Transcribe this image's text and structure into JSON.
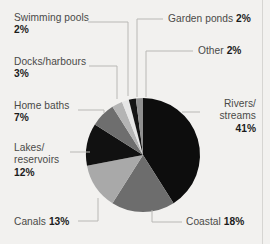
{
  "chart_data": {
    "type": "pie",
    "title": "",
    "subtitle": "",
    "xlabel": "",
    "ylabel": "",
    "legend_position": "callout-labels",
    "grid": false,
    "units": "%",
    "categories": [
      "Rivers/streams",
      "Coastal",
      "Canals",
      "Lakes/reservoirs",
      "Home baths",
      "Docks/harbours",
      "Swimming pools",
      "Garden ponds",
      "Other"
    ],
    "values": [
      41,
      18,
      13,
      12,
      7,
      3,
      2,
      2,
      2
    ],
    "slices": [
      {
        "label": "Rivers/streams",
        "value": 41,
        "value_text": "41%",
        "color": "#0d0d0d",
        "start_deg": 0,
        "end_deg": 147.6
      },
      {
        "label": "Coastal",
        "value": 18,
        "value_text": "18%",
        "color": "#6d6d6d",
        "start_deg": 147.6,
        "end_deg": 212.4
      },
      {
        "label": "Canals",
        "value": 13,
        "value_text": "13%",
        "color": "#a9a9a9",
        "start_deg": 212.4,
        "end_deg": 259.2
      },
      {
        "label": "Lakes/reservoirs",
        "value": 12,
        "value_text": "12%",
        "color": "#111111",
        "start_deg": 259.2,
        "end_deg": 302.4
      },
      {
        "label": "Home baths",
        "value": 7,
        "value_text": "7%",
        "color": "#6e6e6e",
        "start_deg": 302.4,
        "end_deg": 327.6
      },
      {
        "label": "Docks/harbours",
        "value": 3,
        "value_text": "3%",
        "color": "#b4b4b4",
        "start_deg": 327.6,
        "end_deg": 338.4
      },
      {
        "label": "Swimming pools",
        "value": 2,
        "value_text": "2%",
        "color": "#e6e6e6",
        "start_deg": 338.4,
        "end_deg": 345.6
      },
      {
        "label": "Garden ponds",
        "value": 2,
        "value_text": "2%",
        "color": "#141414",
        "start_deg": 345.6,
        "end_deg": 352.8
      },
      {
        "label": "Other",
        "value": 2,
        "value_text": "2%",
        "color": "#8f8f8f",
        "start_deg": 352.8,
        "end_deg": 360
      }
    ]
  },
  "labels": {
    "swimming_pools": {
      "name": "Swimming pools",
      "pct": "2%"
    },
    "docks_harbours": {
      "name": "Docks/harbours",
      "pct": "3%"
    },
    "home_baths": {
      "name": "Home baths",
      "pct": "7%"
    },
    "lakes_line1": "Lakes/",
    "lakes_line2": "reservoirs",
    "lakes_pct": "12%",
    "canals": {
      "name": "Canals",
      "pct": "13%"
    },
    "garden_ponds": {
      "name": "Garden ponds",
      "pct": "2%"
    },
    "other": {
      "name": "Other",
      "pct": "2%"
    },
    "rivers_line1": "Rivers/",
    "rivers_line2": "streams",
    "rivers_pct": "41%",
    "coastal": {
      "name": "Coastal",
      "pct": "18%"
    }
  },
  "colors": {
    "background": "#f2f1ef",
    "leader_line": "#b9b8b5",
    "label_text": "#4a4a48",
    "value_text": "#1b1b1b",
    "border_rule": "#d6d5d2"
  }
}
